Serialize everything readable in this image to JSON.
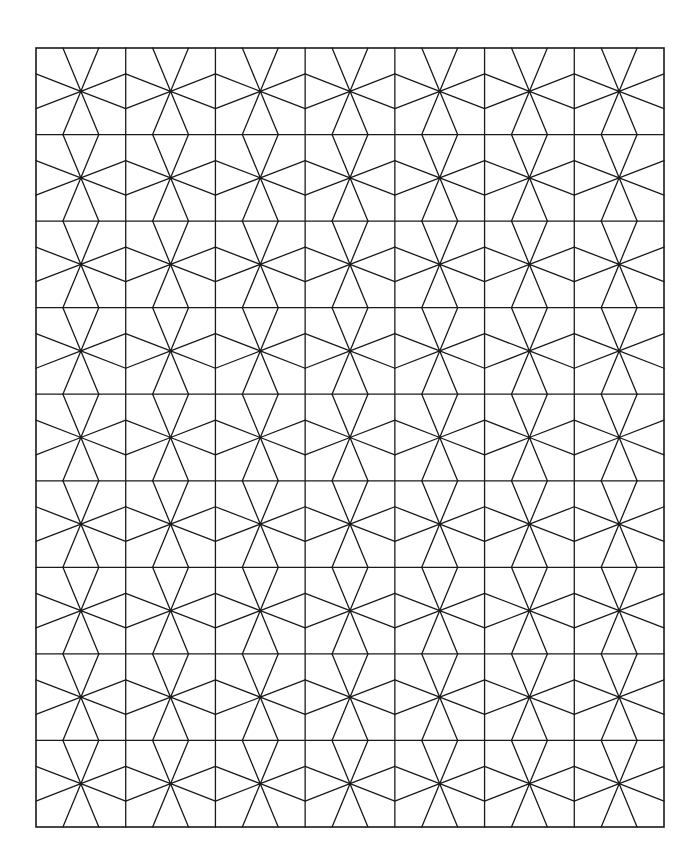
{
  "canvas": {
    "width": 699,
    "height": 863,
    "background": "#ffffff"
  },
  "pattern": {
    "type": "star-tiling-grid",
    "description": "Grid of rectangular cells, each containing an 8-ray star radiating from its center to points on the cell edges",
    "frame": {
      "x": 36,
      "y": 48,
      "width": 628,
      "height": 779
    },
    "columns": 7,
    "rows": 9,
    "stroke_color": "#1a1a1a",
    "stroke_width": 1.3,
    "center_dot_radius": 1.6,
    "edge_point_offset_x_ratio": 0.2,
    "edge_point_offset_y_ratio": 0.2
  }
}
